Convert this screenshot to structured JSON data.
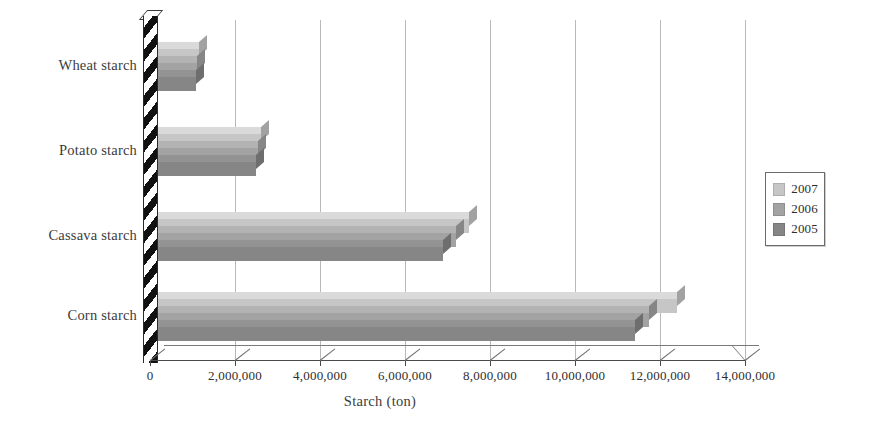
{
  "chart_data": {
    "type": "bar",
    "orientation": "horizontal",
    "title": "",
    "xlabel": "Starch (ton)",
    "ylabel": "",
    "xlim": [
      0,
      14000000
    ],
    "xtick_step": 2000000,
    "grid": true,
    "legend_position": "right",
    "categories": [
      "Wheat starch",
      "Potato starch",
      "Cassava starch",
      "Corn starch"
    ],
    "xtick_labels": [
      "0",
      "2,000,000",
      "4,000,000",
      "6,000,000",
      "8,000,000",
      "10,000,000",
      "12,000,000",
      "14,000,000"
    ],
    "xtick_values": [
      0,
      2000000,
      4000000,
      6000000,
      8000000,
      10000000,
      12000000,
      14000000
    ],
    "series": [
      {
        "name": "2007",
        "color": "#c6c6c6",
        "values": [
          1150000,
          2600000,
          7500000,
          12400000
        ]
      },
      {
        "name": "2006",
        "color": "#a3a3a3",
        "values": [
          1100000,
          2550000,
          7200000,
          11750000
        ]
      },
      {
        "name": "2005",
        "color": "#868686",
        "values": [
          1080000,
          2500000,
          6900000,
          11400000
        ]
      }
    ]
  },
  "legend": {
    "items": [
      {
        "label": "2007",
        "color": "#c6c6c6"
      },
      {
        "label": "2006",
        "color": "#a3a3a3"
      },
      {
        "label": "2005",
        "color": "#868686"
      }
    ]
  },
  "axis": {
    "x_title": "Starch (ton)"
  },
  "colors": {
    "gridline": "#b9b9b9",
    "axis": "#4a4a4a",
    "text": "#2e2e2e",
    "background": "#ffffff"
  }
}
